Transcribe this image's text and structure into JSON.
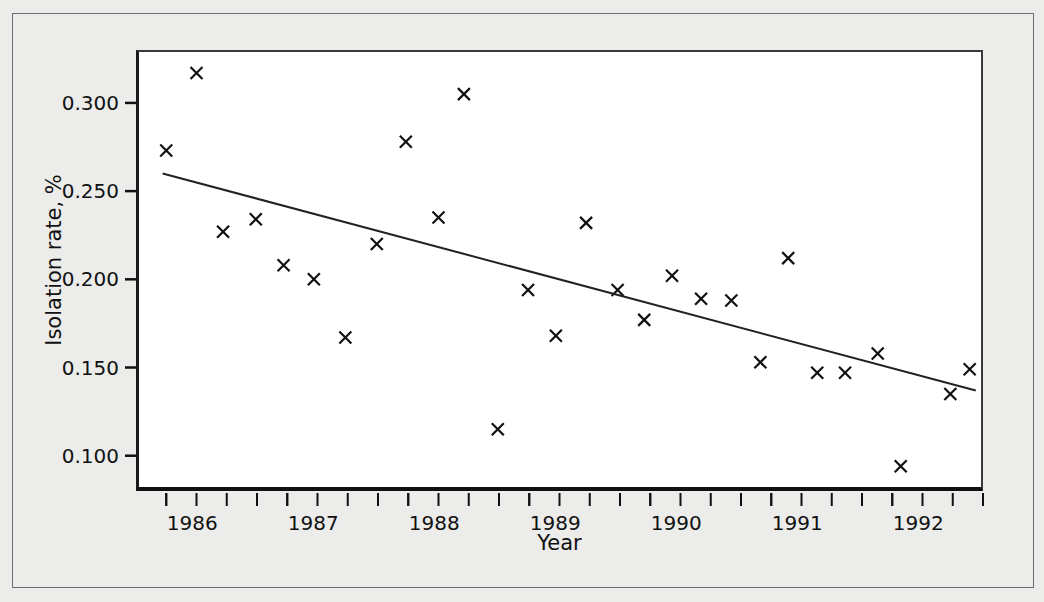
{
  "figure": {
    "background_color": "#ececea",
    "plot_background_color": "#ffffff",
    "axis_color": "#111111",
    "marker_color": "#111111",
    "trendline_color": "#222222"
  },
  "axes": {
    "x_title": "Year",
    "y_title": "Isolation rate, %",
    "y_tick_labels": [
      "0.300",
      "0.250",
      "0.200",
      "0.150",
      "0.100"
    ],
    "x_tick_labels": [
      "1986",
      "1987",
      "1988",
      "1989",
      "1990",
      "1991",
      "1992"
    ]
  },
  "chart_data": {
    "type": "scatter",
    "title": "",
    "xlabel": "Year",
    "ylabel": "Isolation rate, %",
    "xlim": [
      1985.75,
      1992.75
    ],
    "ylim": [
      0.08,
      0.33
    ],
    "yticks": [
      0.3,
      0.25,
      0.2,
      0.15,
      0.1
    ],
    "ytick_labels": [
      "0.300",
      "0.250",
      "0.200",
      "0.150",
      "0.100"
    ],
    "xticks": [
      1986,
      1987,
      1988,
      1989,
      1990,
      1991,
      1992
    ],
    "xtick_labels": [
      "1986",
      "1987",
      "1988",
      "1989",
      "1990",
      "1991",
      "1992"
    ],
    "minor_xtick_interval": 0.25,
    "grid": false,
    "legend": null,
    "marker": "x",
    "series": [
      {
        "name": "Isolation rate",
        "x": [
          1986.25,
          1986.0,
          1986.47,
          1986.74,
          1986.97,
          1987.22,
          1987.48,
          1987.74,
          1987.98,
          1988.25,
          1988.46,
          1988.74,
          1988.99,
          1989.22,
          1989.47,
          1989.73,
          1989.95,
          1990.18,
          1990.42,
          1990.67,
          1990.91,
          1991.14,
          1991.38,
          1991.61,
          1991.88,
          1992.07,
          1992.48,
          1992.64
        ],
        "y": [
          0.317,
          0.273,
          0.227,
          0.234,
          0.208,
          0.2,
          0.167,
          0.22,
          0.278,
          0.235,
          0.305,
          0.115,
          0.194,
          0.168,
          0.232,
          0.194,
          0.177,
          0.202,
          0.189,
          0.188,
          0.153,
          0.212,
          0.147,
          0.147,
          0.158,
          0.094,
          0.135,
          0.149
        ]
      }
    ],
    "trendline": {
      "type": "linear-fit",
      "x_start": 1985.97,
      "y_start": 0.26,
      "x_end": 1992.69,
      "y_end": 0.137
    }
  }
}
